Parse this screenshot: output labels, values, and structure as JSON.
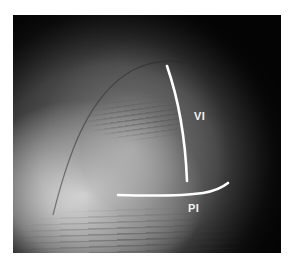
{
  "figure": {
    "tones": {
      "background": "#ffffff",
      "photo_dark": "#0b0b0b",
      "photo_mid": "#5a5a5a",
      "photo_highlight": "#f8f8f8",
      "annotation": "#ffffff"
    },
    "annotations": [
      {
        "id": "vi",
        "label": "VI",
        "type": "curved-vertical-line"
      },
      {
        "id": "pi",
        "label": "PI",
        "type": "curved-horizontal-line"
      }
    ]
  }
}
